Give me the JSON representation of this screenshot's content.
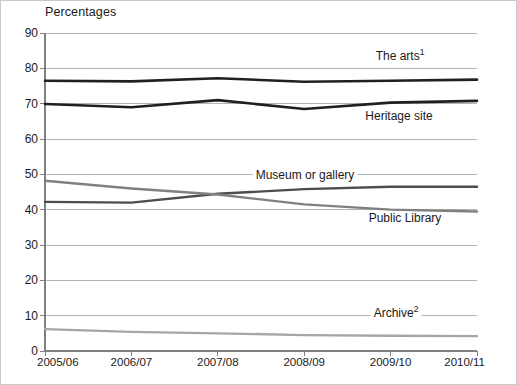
{
  "axis_title": "Percentages",
  "colors": {
    "arts": "#231f20",
    "heritage": "#231f20",
    "museum": "#4d4d4d",
    "library": "#808080",
    "archive": "#a6a6a6",
    "gridline": "#b3b3b3",
    "axis": "#808080",
    "text": "#1a1a1a"
  },
  "labels": {
    "arts": "The arts",
    "arts_sup": "1",
    "heritage": "Heritage site",
    "museum": "Museum or gallery",
    "library": "Public Library",
    "archive": "Archive",
    "archive_sup": "2"
  },
  "chart_data": {
    "type": "line",
    "title": "",
    "subtitle": "",
    "xlabel": "",
    "ylabel": "Percentages",
    "ylim": [
      0,
      90
    ],
    "yticks": [
      0,
      10,
      20,
      30,
      40,
      50,
      60,
      70,
      80,
      90
    ],
    "ytick_labels": [
      "0",
      "10",
      "20",
      "30",
      "40",
      "50",
      "60",
      "70",
      "80",
      "90"
    ],
    "grid": true,
    "legend": "inline-labels",
    "categories": [
      "2005/06",
      "2006/07",
      "2007/08",
      "2008/09",
      "2009/10",
      "2010/11"
    ],
    "series": [
      {
        "name": "The arts",
        "values": [
          76.5,
          76.3,
          77.2,
          76.2,
          76.5,
          76.8
        ]
      },
      {
        "name": "Heritage site",
        "values": [
          69.9,
          69.0,
          71.0,
          68.5,
          70.3,
          70.8
        ]
      },
      {
        "name": "Museum or gallery",
        "values": [
          42.2,
          42.0,
          44.5,
          45.8,
          46.5,
          46.5
        ]
      },
      {
        "name": "Public Library",
        "values": [
          48.2,
          46.0,
          44.3,
          41.5,
          40.0,
          39.5
        ]
      },
      {
        "name": "Archive",
        "values": [
          6.2,
          5.4,
          5.0,
          4.5,
          4.3,
          4.2
        ]
      }
    ]
  }
}
